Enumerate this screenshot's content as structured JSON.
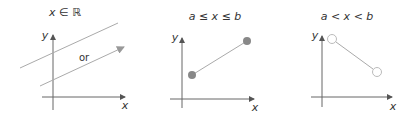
{
  "colors": {
    "axis": "#666666",
    "line": "#aaaaaa",
    "closed_dot": "#888888",
    "open_dot_stroke": "#bbbbbb",
    "text": "#333333"
  },
  "panels": [
    {
      "title": "x ∈ ℝ",
      "x_label": "x",
      "y_label": "y",
      "middle_text": "or",
      "description": "Two infinite lines (all real x): one without an arrow, one with an arrow"
    },
    {
      "title": "a ≤ x ≤ b",
      "x_label": "x",
      "y_label": "y",
      "endpoints": "closed",
      "description": "Closed interval segment with filled endpoints"
    },
    {
      "title": "a < x < b",
      "x_label": "x",
      "y_label": "y",
      "endpoints": "open",
      "description": "Open interval segment with hollow endpoints"
    }
  ]
}
